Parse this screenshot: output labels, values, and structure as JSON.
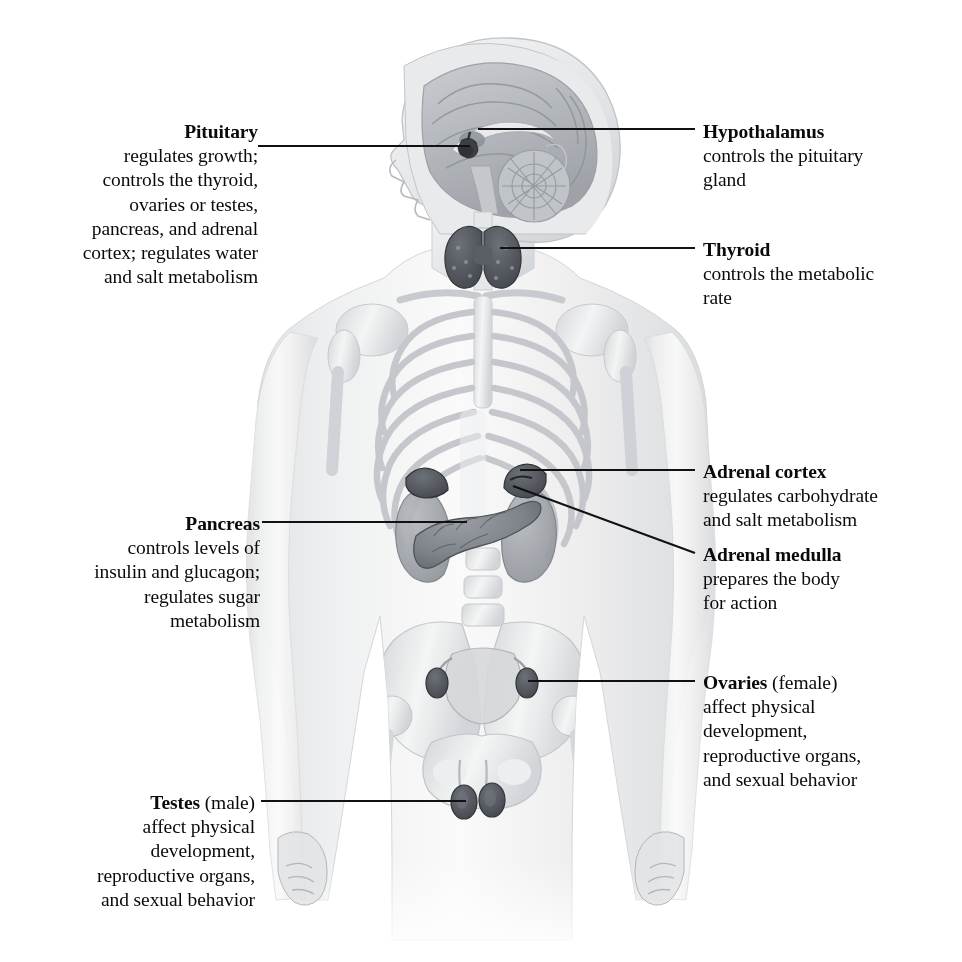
{
  "figure": {
    "background_color": "#ffffff",
    "text_color": "#0a0a0a",
    "leader_line_color": "#111111",
    "artwork_tone": "#b9bcc0"
  },
  "labels": {
    "pituitary": {
      "term": "Pituitary",
      "qualifier": "",
      "desc_lines": [
        "regulates growth;",
        "controls the thyroid,",
        "ovaries or testes,",
        "pancreas, and adrenal",
        "cortex; regulates water",
        "and salt metabolism"
      ]
    },
    "pancreas": {
      "term": "Pancreas",
      "qualifier": "",
      "desc_lines": [
        "controls levels of",
        "insulin and glucagon;",
        "regulates sugar",
        "metabolism"
      ]
    },
    "testes": {
      "term": "Testes",
      "qualifier": " (male)",
      "desc_lines": [
        "affect physical",
        "development,",
        "reproductive organs,",
        "and sexual behavior"
      ]
    },
    "hypothalamus": {
      "term": "Hypothalamus",
      "qualifier": "",
      "desc_lines": [
        "controls the pituitary",
        "gland"
      ]
    },
    "thyroid": {
      "term": "Thyroid",
      "qualifier": "",
      "desc_lines": [
        "controls the metabolic",
        "rate"
      ]
    },
    "adrenal_cortex": {
      "term": "Adrenal cortex",
      "qualifier": "",
      "desc_lines": [
        "regulates carbohydrate",
        "and salt metabolism"
      ]
    },
    "adrenal_medulla": {
      "term": "Adrenal medulla",
      "qualifier": "",
      "desc_lines": [
        "prepares the body",
        "for action"
      ]
    },
    "ovaries": {
      "term": "Ovaries",
      "qualifier": " (female)",
      "desc_lines": [
        "affect physical",
        "development,",
        "reproductive organs,",
        "and sexual behavior"
      ]
    }
  },
  "anatomy_parts": [
    "head-sagittal-section",
    "brain",
    "cerebellum",
    "pituitary-gland",
    "hypothalamus",
    "thyroid-gland",
    "rib-cage",
    "spine",
    "clavicle",
    "scapula",
    "humerus",
    "kidneys",
    "adrenal-glands",
    "pancreas",
    "pelvis",
    "uterus-and-ovaries",
    "testes",
    "femur",
    "hands"
  ]
}
